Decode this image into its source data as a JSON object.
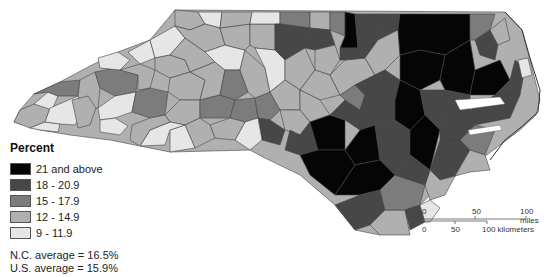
{
  "map": {
    "region": "North Carolina counties",
    "fill_scheme": "grayscale choropleth"
  },
  "legend": {
    "title": "Percent",
    "items": [
      {
        "label": "21 and above",
        "color": "#050505"
      },
      {
        "label": "18 - 20.9",
        "color": "#474747"
      },
      {
        "label": "15 - 17.9",
        "color": "#7c7c7c"
      },
      {
        "label": "12 - 14.9",
        "color": "#b0b0b0"
      },
      {
        "label": "9 - 11.9",
        "color": "#e6e6e6"
      }
    ]
  },
  "averages": {
    "nc": "N.C. average = 16.5%",
    "us": "U.S. average = 15.9%"
  },
  "scale_bar": {
    "miles_ticks": [
      "0",
      "50",
      "100 miles"
    ],
    "km_ticks": [
      "0",
      "50",
      "100 kilometers"
    ]
  }
}
